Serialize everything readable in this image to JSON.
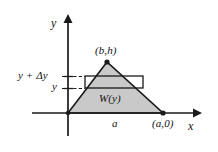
{
  "figure": {
    "type": "geometry-diagram",
    "background_color": "#ffffff",
    "stroke_color": "#1a1a1a",
    "fill_color": "#c8c8c8",
    "axes": {
      "x_label": "x",
      "y_label": "y",
      "origin_px": [
        68,
        113
      ],
      "x_axis_end_px": [
        200,
        113
      ],
      "y_axis_end_px": [
        68,
        16
      ]
    },
    "triangle": {
      "vertices_px": [
        [
          68,
          113
        ],
        [
          107,
          62
        ],
        [
          163,
          113
        ]
      ],
      "apex_label": "(b,h)",
      "base_right_label": "(a,0)",
      "base_label": "a"
    },
    "strip": {
      "label": "W(y)",
      "rect_px": [
        85,
        76,
        58,
        12
      ],
      "lower_tick_label": "y",
      "upper_tick_label": "y + Δy",
      "lower_tick_y_px": 88,
      "upper_tick_y_px": 76
    }
  }
}
